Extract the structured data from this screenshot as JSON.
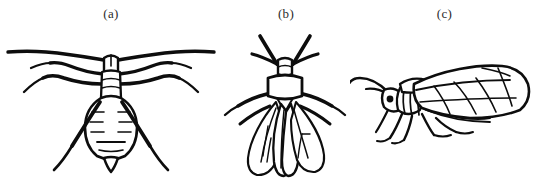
{
  "figure": {
    "background_color": "#ffffff",
    "ink_color": "#0d0d0d",
    "caption_color": "#2b2b2b",
    "panels": [
      {
        "label": "(a)",
        "subject": "wingless aphid, dorsal view",
        "icon": "aphid-apterous-dorsal-icon"
      },
      {
        "label": "(b)",
        "subject": "winged aphid, dorsal view",
        "icon": "aphid-alate-dorsal-icon"
      },
      {
        "label": "(c)",
        "subject": "winged aphid, lateral view",
        "icon": "aphid-alate-lateral-icon"
      }
    ]
  }
}
